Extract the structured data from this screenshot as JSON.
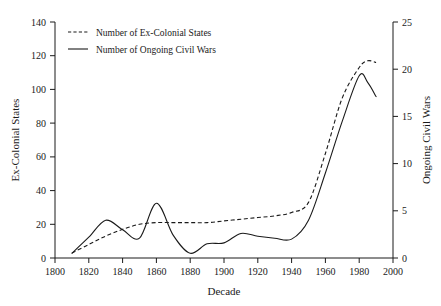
{
  "chart_data": {
    "type": "line",
    "title": "",
    "xlabel": "Decade",
    "ylabel": "Ex-Colonial States",
    "y2label": "Ongoing Civil Wars",
    "xlim": [
      1800,
      2000
    ],
    "ylim": [
      0,
      140
    ],
    "y2lim": [
      0,
      25
    ],
    "grid": false,
    "legend_position": "top-left",
    "xticks": [
      "1800",
      "1820",
      "1840",
      "1860",
      "1880",
      "1900",
      "1920",
      "1940",
      "1960",
      "1980",
      "2000"
    ],
    "xtick_values": [
      1800,
      1820,
      1840,
      1860,
      1880,
      1900,
      1920,
      1940,
      1960,
      1980,
      2000
    ],
    "yticks": [
      "0",
      "20",
      "40",
      "60",
      "80",
      "100",
      "120",
      "140"
    ],
    "ytick_values": [
      0,
      20,
      40,
      60,
      80,
      100,
      120,
      140
    ],
    "y2ticks": [
      "0",
      "5",
      "10",
      "15",
      "20",
      "25"
    ],
    "y2tick_values": [
      0,
      5,
      10,
      15,
      20,
      25
    ],
    "series": [
      {
        "name": "Number of Ex-Colonial States",
        "style": "dashed",
        "axis": "left",
        "units": "states",
        "x": [
          1810,
          1820,
          1830,
          1840,
          1850,
          1860,
          1870,
          1880,
          1890,
          1900,
          1910,
          1920,
          1930,
          1940,
          1950,
          1960,
          1970,
          1980,
          1985,
          1990
        ],
        "values": [
          3,
          8,
          13,
          17,
          20,
          21,
          21,
          21,
          21,
          22,
          23,
          24,
          25,
          27,
          33,
          62,
          95,
          113,
          117,
          116
        ]
      },
      {
        "name": "Number of Ongoing Civil Wars",
        "style": "solid",
        "axis": "right",
        "units": "wars",
        "x": [
          1810,
          1820,
          1830,
          1840,
          1850,
          1860,
          1870,
          1880,
          1890,
          1900,
          1910,
          1920,
          1930,
          1940,
          1950,
          1960,
          1970,
          1980,
          1985,
          1990
        ],
        "values": [
          0.5,
          2.2,
          4.0,
          3.0,
          2.1,
          5.8,
          2.4,
          0.5,
          1.5,
          1.6,
          2.6,
          2.3,
          2.1,
          2.0,
          4.0,
          9.0,
          14.5,
          19.3,
          18.6,
          17.1
        ]
      }
    ],
    "legend": [
      {
        "label": "Number of Ex-Colonial States",
        "style": "dashed"
      },
      {
        "label": "Number of Ongoing Civil Wars",
        "style": "solid"
      }
    ]
  }
}
